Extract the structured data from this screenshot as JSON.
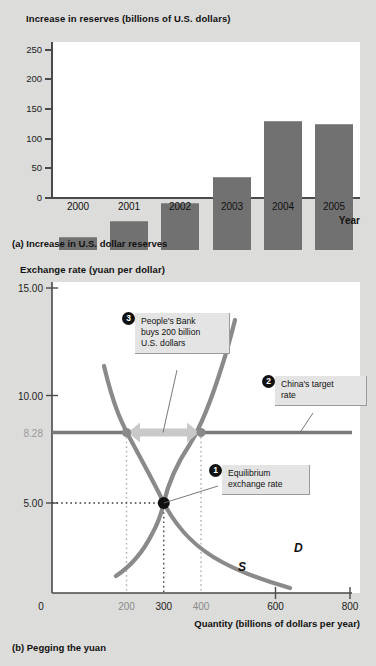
{
  "chart_data": [
    {
      "type": "bar",
      "id": "increase-in-reserves",
      "title": "Increase in reserves (billions of U.S. dollars)",
      "panel_caption": "(a) Increase in U.S. dollar reserves",
      "xlabel": "Year",
      "ylabel": "Increase in reserves (billions of U.S. dollars)",
      "categories": [
        "2000",
        "2001",
        "2002",
        "2003",
        "2004",
        "2005"
      ],
      "values": [
        20,
        46,
        74,
        116,
        207,
        202
      ],
      "ylim": [
        0,
        250
      ],
      "yticks": [
        0,
        50,
        100,
        150,
        200,
        250
      ],
      "ytick_labels": [
        "0",
        "50",
        "100",
        "150",
        "200",
        "250"
      ],
      "grid": false,
      "legend": "none",
      "bar_color": "#717171",
      "plot_background": "#ffffff"
    },
    {
      "type": "line",
      "id": "pegging-the-yuan",
      "title": "Exchange rate (yuan per dollar)",
      "panel_caption": "(b) Pegging the yuan",
      "xlabel": "Quantity (billions of dollars per year)",
      "ylabel": "Exchange rate (yuan per dollar)",
      "xlim": [
        0,
        800
      ],
      "ylim": [
        2.0,
        15.0
      ],
      "xticks": [
        0,
        200,
        300,
        400,
        600,
        800
      ],
      "xtick_labels": [
        "0",
        "200",
        "300",
        "400",
        "600",
        "800"
      ],
      "yticks": [
        5.0,
        8.28,
        10.0,
        15.0
      ],
      "ytick_labels": [
        "5.00",
        "8.28",
        "10.00",
        "15.00"
      ],
      "grid": false,
      "legend": "none",
      "series": [
        {
          "name": "S",
          "label": "S",
          "kind": "supply",
          "color": "#8a8a8a",
          "points": [
            [
              180,
              2.6
            ],
            [
              240,
              3.6
            ],
            [
              300,
              5.0
            ],
            [
              360,
              7.1
            ],
            [
              400,
              8.28
            ],
            [
              440,
              10.2
            ],
            [
              470,
              12.6
            ]
          ]
        },
        {
          "name": "D",
          "label": "D",
          "kind": "demand",
          "color": "#8a8a8a",
          "points": [
            [
              140,
              12.6
            ],
            [
              170,
              9.6
            ],
            [
              200,
              8.28
            ],
            [
              250,
              6.2
            ],
            [
              300,
              5.0
            ],
            [
              400,
              3.9
            ],
            [
              520,
              3.2
            ],
            [
              640,
              2.7
            ]
          ]
        }
      ],
      "annotations": [
        {
          "number": "1",
          "text": "Equilibrium exchange rate",
          "lines": [
            "Equilibrium",
            "exchange rate"
          ],
          "target_point": [
            300,
            5.0
          ]
        },
        {
          "number": "2",
          "text": "China's target rate",
          "lines": [
            "China's target",
            "rate"
          ],
          "target_value": 8.28
        },
        {
          "number": "3",
          "text": "People's Bank buys 200 billion U.S. dollars",
          "lines": [
            "People's Bank",
            "buys 200 billion",
            "U.S. dollars"
          ],
          "target_range": [
            200,
            400
          ]
        }
      ],
      "peg_line": {
        "value": 8.28,
        "label": "8.28",
        "color": "#7a7a7a"
      },
      "equilibrium": {
        "quantity": 300,
        "rate": 5.0
      },
      "intervention_arrow": {
        "from": 200,
        "to": 400,
        "at_rate": 8.28,
        "amount": 200
      }
    }
  ],
  "chart_a": {
    "title": "Increase in reserves (billions of U.S. dollars)",
    "caption": "(a) Increase in U.S. dollar reserves",
    "x_axis_name": "Year",
    "y_ticks": [
      "250",
      "200",
      "150",
      "100",
      "50",
      "0"
    ],
    "bars": [
      {
        "label": "2000",
        "value": 20
      },
      {
        "label": "2001",
        "value": 46
      },
      {
        "label": "2002",
        "value": 74
      },
      {
        "label": "2003",
        "value": 116
      },
      {
        "label": "2004",
        "value": 207
      },
      {
        "label": "2005",
        "value": 202
      }
    ]
  },
  "chart_b": {
    "title": "Exchange rate (yuan per dollar)",
    "caption": "(b) Pegging the yuan",
    "x_axis_name": "Quantity (billions of dollars per year)",
    "y_ticks": [
      {
        "label": "15.00",
        "muted": false
      },
      {
        "label": "10.00",
        "muted": false
      },
      {
        "label": "8.28",
        "muted": true
      },
      {
        "label": "5.00",
        "muted": false
      }
    ],
    "x_ticks": [
      {
        "label": "0",
        "muted": false
      },
      {
        "label": "200",
        "muted": true
      },
      {
        "label": "300",
        "muted": false
      },
      {
        "label": "400",
        "muted": true
      },
      {
        "label": "600",
        "muted": false
      },
      {
        "label": "800",
        "muted": false
      }
    ],
    "supply_label": "S",
    "demand_label": "D",
    "callout_1": {
      "number": "1",
      "line1": "Equilibrium",
      "line2": "exchange rate"
    },
    "callout_2": {
      "number": "2",
      "line1": "China's target",
      "line2": "rate"
    },
    "callout_3": {
      "number": "3",
      "line1": "People's Bank",
      "line2": "buys 200 billion",
      "line3": "U.S. dollars"
    }
  },
  "colors": {
    "page_background": "#dcdcda",
    "plot_background": "#ffffff",
    "bar": "#717171",
    "curve": "#8a8a8a",
    "peg_line": "#7a7a7a",
    "axis": "#4a4a4a",
    "callout_background": "#e4e4e4",
    "badge": "#111111"
  }
}
